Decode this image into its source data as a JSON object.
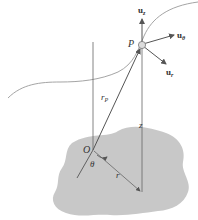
{
  "diagram": {
    "colors": {
      "ground": "#c8c8c8",
      "lines": "#555555",
      "curve": "#9a9a9a",
      "point": "#d8d8d8"
    },
    "labels": {
      "point": "P",
      "unit_z": "u",
      "unit_z_sub": "z",
      "unit_theta": "u",
      "unit_theta_sub": "θ",
      "unit_r": "u",
      "unit_r_sub": "r",
      "position_vector": "r",
      "position_vector_sub": "P",
      "height": "z",
      "origin": "O",
      "angle": "θ",
      "radius": "r"
    }
  }
}
